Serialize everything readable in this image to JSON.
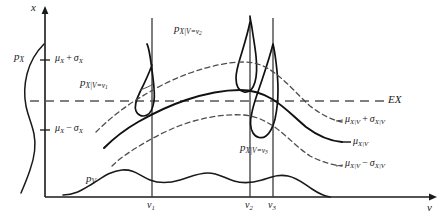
{
  "figure": {
    "type": "statistical-diagram",
    "axes": {
      "x_axis_label": "x",
      "v_axis_label": "v",
      "x_axis_x_px": 45,
      "v_axis_y_px": 197
    },
    "ticks": {
      "x": [
        {
          "id": "mu_plus_sigma",
          "label_plain": "μX + σX",
          "y_px": 60
        },
        {
          "id": "mu_minus_sigma",
          "label_plain": "μX − σX",
          "y_px": 130
        }
      ],
      "v": [
        {
          "id": "v1",
          "label_plain": "v1",
          "x_px": 152
        },
        {
          "id": "v2",
          "label_plain": "v2",
          "x_px": 250
        },
        {
          "id": "v3",
          "label_plain": "v3",
          "x_px": 273
        }
      ]
    },
    "labels": {
      "x_axis": {
        "base": "x",
        "sub": "",
        "x": 31,
        "y": 3,
        "size": 11
      },
      "v_axis": {
        "base": "v",
        "sub": "",
        "x": 428,
        "y": 203,
        "size": 11
      },
      "p_X": {
        "base": "p",
        "sub": "X",
        "x": 14,
        "y": 52,
        "size": 11
      },
      "p_V": {
        "base": "p",
        "sub": "V",
        "x": 86,
        "y": 174,
        "size": 11
      },
      "mu_plus_sigma_X": {
        "text": "μ",
        "sub1": "X",
        "op": "+",
        "text2": "σ",
        "sub2": "X",
        "x": 56,
        "y": 53,
        "size": 10
      },
      "mu_minus_sigma_X": {
        "text": "μ",
        "sub1": "X",
        "op": "−",
        "text2": "σ",
        "sub2": "X",
        "x": 56,
        "y": 123,
        "size": 10
      },
      "p_X_given_v1": {
        "base": "p",
        "sub": "X|V=v",
        "subsub": "1",
        "x": 80,
        "y": 78,
        "size": 11
      },
      "p_X_given_v2": {
        "base": "p",
        "sub": "X|V=v",
        "subsub": "2",
        "x": 174,
        "y": 24,
        "size": 11
      },
      "p_X_given_v3": {
        "base": "p",
        "sub": "X|V=v",
        "subsub": "3",
        "x": 240,
        "y": 143,
        "size": 11
      },
      "EX": {
        "text": "EX",
        "x": 388,
        "y": 94,
        "size": 11
      },
      "mu_cond_plus": {
        "text": "μ",
        "sub1": "X|V",
        "op": "+",
        "text2": "σ",
        "sub2": "X|V",
        "x": 344,
        "y": 115,
        "size": 10
      },
      "mu_cond": {
        "text": "μ",
        "sub1": "X|V",
        "x": 352,
        "y": 139,
        "size": 10
      },
      "mu_cond_minus": {
        "text": "μ",
        "sub1": "X|V",
        "op": "−",
        "text2": "σ",
        "sub2": "X|V",
        "x": 344,
        "y": 159,
        "size": 10
      }
    },
    "colors": {
      "ink": "#1a1a1a",
      "curve": "#111111",
      "dashed": "#4d4d4d",
      "gridline": "#3a3a3a",
      "ex_line": "#555555"
    },
    "lines": {
      "ex_dashed_y_px": 101,
      "gridline_top_y_px": 18,
      "gridline_bottom_y_px": 197
    }
  }
}
